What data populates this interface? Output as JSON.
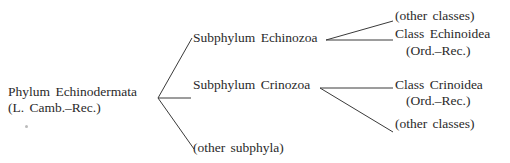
{
  "tree": {
    "root": {
      "label": "Phylum Echinodermata",
      "range": "(L. Camb.–Rec.)"
    },
    "subphyla": [
      {
        "label": "Subphylum Echinozoa",
        "children": [
          {
            "label": "(other classes)"
          },
          {
            "label": "Class Echinoidea",
            "range": "(Ord.–Rec.)"
          }
        ]
      },
      {
        "label": "Subphylum Crinozoa",
        "children": [
          {
            "label": "Class Crinoidea",
            "range": "(Ord.–Rec.)"
          },
          {
            "label": "(other classes)"
          }
        ]
      },
      {
        "label": "(other subphyla)"
      }
    ]
  },
  "colors": {
    "line": "#3a3a3a",
    "text": "#2a2a2a",
    "background": "#ffffff"
  }
}
